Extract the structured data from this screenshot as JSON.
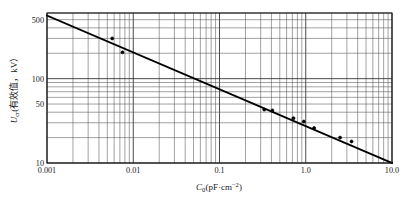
{
  "chart_data": {
    "type": "line",
    "title": "",
    "xlabel": "C0(pF·cm⁻²)",
    "ylabel": "Ucr(有效值, kV)",
    "xscale": "log",
    "yscale": "log",
    "xlim": [
      0.001,
      10.0
    ],
    "ylim": [
      10,
      600
    ],
    "grid": "both-major-and-minor",
    "legend": "none",
    "x_tick_labels": [
      "0.001",
      "0.01",
      "0.1",
      "1.0",
      "10.0"
    ],
    "x_tick_values": [
      0.001,
      0.01,
      0.1,
      1.0,
      10.0
    ],
    "y_tick_labels": [
      "500",
      "100",
      "50",
      "10"
    ],
    "y_tick_values": [
      500,
      100,
      50,
      10
    ],
    "series": [
      {
        "name": "fitted-line",
        "kind": "line",
        "x": [
          0.001,
          10.0
        ],
        "y": [
          560,
          10
        ]
      },
      {
        "name": "measured-points",
        "kind": "scatter",
        "points": [
          {
            "x": 0.0057,
            "y": 300
          },
          {
            "x": 0.0075,
            "y": 205
          },
          {
            "x": 0.33,
            "y": 43
          },
          {
            "x": 0.41,
            "y": 42
          },
          {
            "x": 0.72,
            "y": 34
          },
          {
            "x": 0.95,
            "y": 31
          },
          {
            "x": 1.25,
            "y": 26
          },
          {
            "x": 2.5,
            "y": 20
          },
          {
            "x": 3.4,
            "y": 18
          }
        ]
      }
    ],
    "y_axis_label_parts": {
      "symbol": "U",
      "subscript": "cr",
      "paren": "(有效值，kV）"
    },
    "x_axis_label_parts": {
      "symbol": "C",
      "subscript": "0",
      "paren": "(pF·cm",
      "superscript": "−2",
      "close": ")"
    }
  }
}
